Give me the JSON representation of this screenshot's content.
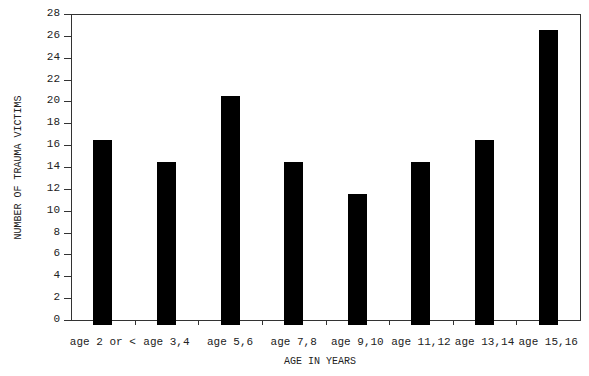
{
  "chart_data": {
    "type": "bar",
    "title": "",
    "xlabel": "AGE IN YEARS",
    "ylabel": "NUMBER OF TRAUMA VICTIMS",
    "categories": [
      "age 2 or <",
      "age 3,4",
      "age 5,6",
      "age 7,8",
      "age 9,10",
      "age 11,12",
      "age 13,14",
      "age 15,16"
    ],
    "values": [
      16.5,
      14.5,
      20.5,
      14.5,
      11.5,
      14.5,
      16.5,
      26.5
    ],
    "ylim": [
      0,
      28
    ],
    "yticks": [
      0,
      2,
      4,
      6,
      8,
      10,
      12,
      14,
      16,
      18,
      20,
      22,
      24,
      26,
      28
    ],
    "grid": false,
    "legend": null,
    "bar_color": "#000000"
  }
}
